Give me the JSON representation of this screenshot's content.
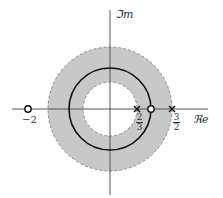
{
  "diagram": {
    "type": "pole-zero plot",
    "axes": {
      "imag_label": "ℑm",
      "real_label": "ℜe"
    },
    "region": {
      "description": "ROC annulus",
      "inner_radius": "2/3",
      "outer_radius": "3/2",
      "fill_color": "#c8c8c8",
      "border": "dashed"
    },
    "unit_circle": {
      "radius": 1,
      "style": "solid"
    },
    "zeros": [
      {
        "position": "-2",
        "label": "−2"
      },
      {
        "position": "1",
        "label": ""
      }
    ],
    "poles": [
      {
        "position": "2/3",
        "label_num": "2",
        "label_den": "3"
      },
      {
        "position": "3/2",
        "label_num": "3",
        "label_den": "2"
      }
    ]
  }
}
